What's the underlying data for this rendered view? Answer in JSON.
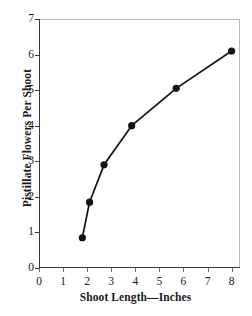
{
  "chart_data": {
    "type": "line",
    "title": "",
    "xlabel": "Shoot Length—Inches",
    "ylabel": "Pistillate Flowers Per Shoot",
    "x": [
      1.8,
      2.1,
      2.7,
      3.85,
      5.7,
      8.0
    ],
    "values": [
      0.85,
      1.85,
      2.9,
      4.0,
      5.05,
      6.1
    ],
    "series": [
      {
        "name": "Pistillate flowers per shoot",
        "x": [
          1.8,
          2.1,
          2.7,
          3.85,
          5.7,
          8.0
        ],
        "values": [
          0.85,
          1.85,
          2.9,
          4.0,
          5.05,
          6.1
        ]
      }
    ],
    "xlim": [
      0,
      8.35
    ],
    "ylim": [
      0,
      7
    ],
    "xticks": [
      0,
      1,
      2,
      3,
      4,
      5,
      6,
      7,
      8
    ],
    "yticks": [
      0,
      1,
      2,
      3,
      4,
      5,
      6,
      7
    ],
    "xtick_labels": [
      "0",
      "1",
      "2",
      "3",
      "4",
      "5",
      "6",
      "7",
      "8"
    ],
    "ytick_labels": [
      "0",
      "1",
      "2",
      "3",
      "4",
      "5",
      "6",
      "7"
    ],
    "grid": false,
    "legend": null,
    "marker": "filled-circle",
    "marker_color": "#111111",
    "line_color": "#111111",
    "background": "#ffffff"
  }
}
